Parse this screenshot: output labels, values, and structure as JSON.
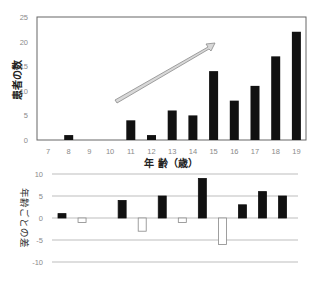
{
  "chart_data": [
    {
      "type": "bar",
      "title": "",
      "xlabel": "年 齢（歳）",
      "ylabel": "患者の数",
      "categories": [
        "7",
        "8",
        "9",
        "10",
        "11",
        "12",
        "13",
        "14",
        "15",
        "16",
        "17",
        "18",
        "19"
      ],
      "values": [
        0,
        1,
        0,
        0,
        4,
        1,
        6,
        5,
        14,
        8,
        11,
        17,
        22
      ],
      "ylim": [
        0,
        25
      ],
      "yticks": [
        "0",
        "5",
        "10",
        "15",
        "20",
        "25"
      ],
      "grid": false,
      "bar_color": "#111111",
      "annotations": [
        {
          "type": "arrow",
          "description": "upward trend arrow from ~age 11 to ~age 15",
          "color": "#cccccc"
        }
      ]
    },
    {
      "type": "bar",
      "title": "",
      "xlabel": "",
      "ylabel": "年齢ごとの差",
      "categories": [
        "8",
        "9",
        "10",
        "11",
        "12",
        "13",
        "14",
        "15",
        "16",
        "17",
        "18",
        "19"
      ],
      "values": [
        1,
        -1,
        0,
        4,
        -3,
        5,
        -1,
        9,
        -6,
        3,
        6,
        5
      ],
      "ylim": [
        -10,
        10
      ],
      "yticks": [
        "10",
        "5",
        "0",
        "-5",
        "-10"
      ],
      "grid": true,
      "positive_color": "#111111",
      "negative_color": "#ffffff"
    }
  ],
  "top": {
    "ylabel": "患者の数",
    "xlabel": "年 齢（歳）",
    "yticks": [
      "0",
      "5",
      "10",
      "15",
      "20",
      "25"
    ],
    "xticks": [
      "7",
      "8",
      "9",
      "10",
      "11",
      "12",
      "13",
      "14",
      "15",
      "16",
      "17",
      "18",
      "19"
    ]
  },
  "bottom": {
    "ylabel": "年齢ごとの差",
    "yticks": [
      "10",
      "5",
      "0",
      "-5",
      "-10"
    ]
  }
}
